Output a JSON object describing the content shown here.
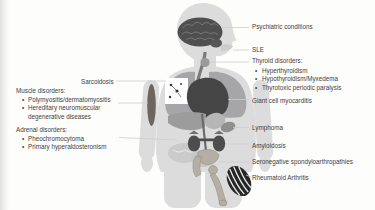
{
  "diagram": {
    "bullet": "•",
    "left": {
      "sarcoidosis": "Sarcoidosis",
      "muscle": {
        "heading": "Muscle disorders:",
        "items": [
          "Polymyositis/dermatomyositis",
          "Hereditary neuromuscular degenerative diseases"
        ]
      },
      "adrenal": {
        "heading": "Adrenal disorders:",
        "items": [
          "Pheochromocytoma",
          "Primary hyperaldosteronism"
        ]
      }
    },
    "right": {
      "psychiatric": "Psychiatric conditions",
      "sle": "SLE",
      "thyroid": {
        "heading": "Thyroid disorders:",
        "items": [
          "Hyperthyroidism",
          "Hypothyroidism/Myxedema",
          "Thyrotoxic periodic paralysis"
        ]
      },
      "giant_cell": "Giant cell myocarditis",
      "lymphoma": "Lymphoma",
      "amyloidosis": "Amyloidosis",
      "seronegative": "Seronegative spondyloarthropathies",
      "rheumatoid": "Rheumatoid Arthritis"
    },
    "colors": {
      "text": "#3e3e3e",
      "background": "#fdfdfc",
      "body_silhouette": "#dcdcdc",
      "organ_dark": "#4a4a4a",
      "organ_mid": "#a6a6a8",
      "leader_line": "#cfccca",
      "bone": "#b5aea4",
      "hand_dark": "#262626"
    },
    "body_parts": [
      "brain",
      "thyroid",
      "trachea",
      "lungs",
      "heart",
      "sarcoid-granulomas",
      "arm-muscle",
      "liver",
      "stomach",
      "spleen",
      "kidneys",
      "adrenal-glands",
      "intestines",
      "aorta",
      "pelvis",
      "femur",
      "rheumatoid-hand"
    ]
  }
}
